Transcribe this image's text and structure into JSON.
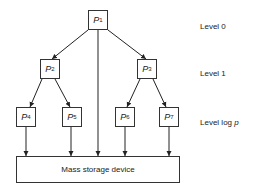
{
  "diagram": {
    "type": "binary tree of processors connected to mass storage",
    "nodes": [
      {
        "id": "P1",
        "letter": "P",
        "sub": "1",
        "level": 0
      },
      {
        "id": "P2",
        "letter": "P",
        "sub": "2",
        "level": 1
      },
      {
        "id": "P3",
        "letter": "P",
        "sub": "3",
        "level": 1
      },
      {
        "id": "P4",
        "letter": "P",
        "sub": "4",
        "level": 2
      },
      {
        "id": "P5",
        "letter": "P",
        "sub": "5",
        "level": 2
      },
      {
        "id": "P6",
        "letter": "P",
        "sub": "6",
        "level": 2
      },
      {
        "id": "P7",
        "letter": "P",
        "sub": "7",
        "level": 2
      }
    ],
    "edges": [
      {
        "from": "P1",
        "to": "P2",
        "bidirectional": true
      },
      {
        "from": "P1",
        "to": "P3",
        "bidirectional": true
      },
      {
        "from": "P2",
        "to": "P4",
        "bidirectional": true
      },
      {
        "from": "P2",
        "to": "P5",
        "bidirectional": true
      },
      {
        "from": "P3",
        "to": "P6",
        "bidirectional": true
      },
      {
        "from": "P3",
        "to": "P7",
        "bidirectional": true
      },
      {
        "from": "P1",
        "to": "storage",
        "bidirectional": false
      },
      {
        "from": "P4",
        "to": "storage",
        "bidirectional": true
      },
      {
        "from": "P5",
        "to": "storage",
        "bidirectional": true
      },
      {
        "from": "P6",
        "to": "storage",
        "bidirectional": true
      },
      {
        "from": "P7",
        "to": "storage",
        "bidirectional": true
      }
    ],
    "storage_label": "Mass storage device",
    "levels": {
      "level0": "Level 0",
      "level1": "Level 1",
      "levelp_prefix": "Level log ",
      "levelp_var": "p"
    }
  }
}
